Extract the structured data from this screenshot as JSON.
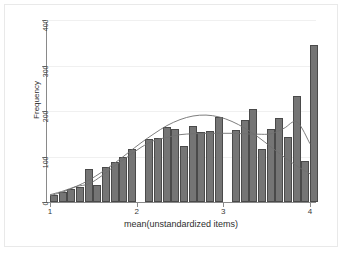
{
  "chart_data": {
    "type": "bar",
    "title": "",
    "subtitle": "",
    "xlabel": "mean(unstandardized items)",
    "ylabel": "Frequency",
    "xlim": [
      1,
      4
    ],
    "ylim": [
      0,
      400
    ],
    "grid": true,
    "legend": "none",
    "xticks": [
      "1",
      "2",
      "3",
      "4"
    ],
    "xtick_values": [
      1,
      2,
      3,
      4
    ],
    "yticks": [
      "0",
      "100",
      "200",
      "300",
      "400"
    ],
    "ytick_values": [
      0,
      100,
      200,
      300,
      400
    ],
    "bar_color": "#757575",
    "bar_edge_color": "#4a4a4a",
    "bin_width": 0.1,
    "categories": [
      "1.00",
      "1.10",
      "1.20",
      "1.30",
      "1.40",
      "1.50",
      "1.60",
      "1.70",
      "1.80",
      "1.90",
      "2.00",
      "2.10",
      "2.20",
      "2.30",
      "2.40",
      "2.50",
      "2.60",
      "2.70",
      "2.80",
      "2.90",
      "3.00",
      "3.10",
      "3.20",
      "3.30",
      "3.40",
      "3.50",
      "3.60",
      "3.70",
      "3.80",
      "3.90",
      "4.00"
    ],
    "values": [
      16,
      22,
      28,
      34,
      72,
      38,
      78,
      88,
      98,
      117,
      0,
      139,
      141,
      165,
      160,
      124,
      168,
      153,
      157,
      186,
      0,
      158,
      180,
      204,
      117,
      160,
      185,
      143,
      232,
      90,
      345
    ],
    "overlays": [
      {
        "name": "normal-density-curve",
        "type": "line",
        "color": "#6f6f6f",
        "x": [
          1.0,
          1.15,
          1.3,
          1.45,
          1.6,
          1.75,
          1.9,
          2.05,
          2.2,
          2.35,
          2.5,
          2.65,
          2.8,
          2.95,
          3.1,
          3.25,
          3.4,
          3.55,
          3.7,
          3.85,
          4.0
        ],
        "y": [
          14,
          22,
          34,
          48,
          66,
          86,
          108,
          130,
          150,
          168,
          181,
          189,
          191,
          187,
          177,
          162,
          143,
          121,
          99,
          79,
          62
        ]
      },
      {
        "name": "kernel-density-curve",
        "type": "line",
        "color": "#6f6f6f",
        "x": [
          1.0,
          1.15,
          1.3,
          1.45,
          1.6,
          1.75,
          1.9,
          2.05,
          2.2,
          2.35,
          2.5,
          2.65,
          2.8,
          2.95,
          3.1,
          3.25,
          3.4,
          3.55,
          3.7,
          3.85,
          4.0
        ],
        "y": [
          16,
          24,
          34,
          40,
          58,
          80,
          100,
          120,
          135,
          142,
          148,
          150,
          151,
          151,
          151,
          150,
          149,
          150,
          162,
          176,
          128
        ]
      }
    ]
  },
  "figure": {
    "axis_color": "#8a8a8a",
    "grid_color": "#f0f0f0",
    "background": "#ffffff"
  }
}
